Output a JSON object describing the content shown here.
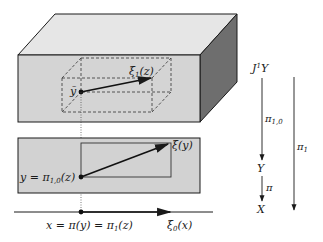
{
  "colors": {
    "front_face": "#d4d4d4",
    "top_face": "#e6e6e6",
    "side_face": "#6e6e6e",
    "lower_rect": "#d2d2d2",
    "stroke": "#1a1a1a",
    "background": "#ffffff"
  },
  "labels": {
    "xi1": {
      "main": "ξ",
      "sub": "1",
      "arg": "(z)"
    },
    "ytilde": "ỹ",
    "xi_y": "ξ(y)",
    "y_eq": {
      "pre": "y = π",
      "sub": "1,0",
      "post": "(z)"
    },
    "x_eq": {
      "pre": "x = π(y) = π",
      "sub": "1",
      "post": "(z)"
    },
    "xi0": {
      "main": "ξ",
      "sub": "0",
      "arg": "(x)"
    }
  },
  "projection_chain": {
    "J1Y": {
      "main": "J",
      "sup": "1",
      "post": "Y"
    },
    "pi10": {
      "main": "π",
      "sub": "1,0"
    },
    "Y": "Y",
    "pi": "π",
    "X": "X",
    "pi1": {
      "main": "π",
      "sub": "1"
    }
  }
}
